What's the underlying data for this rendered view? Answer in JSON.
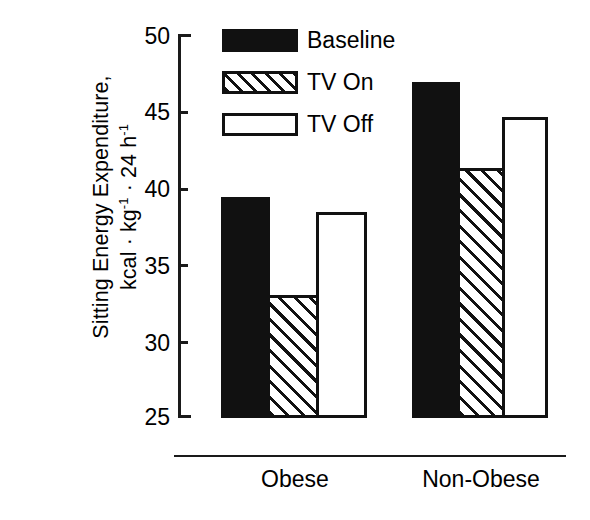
{
  "chart_data": {
    "type": "bar",
    "title": "",
    "xlabel": "",
    "ylabel_line1": "Sitting Energy Expenditure,",
    "ylabel_line2_prefix": "kcal · kg",
    "ylabel_line2_sup1": "-1",
    "ylabel_line2_mid": " · 24 h",
    "ylabel_line2_sup2": "-1",
    "ylabel_full": "Sitting Energy Expenditure, kcal · kg-1 · 24 h-1",
    "categories": [
      "Obese",
      "Non-Obese"
    ],
    "series": [
      {
        "name": "Baseline",
        "pattern": "solid",
        "values": [
          39.4,
          46.9
        ]
      },
      {
        "name": "TV On",
        "pattern": "hatch",
        "values": [
          33.0,
          41.3
        ]
      },
      {
        "name": "TV Off",
        "pattern": "open",
        "values": [
          38.4,
          44.6
        ]
      }
    ],
    "ylim": [
      25,
      50
    ],
    "yticks": [
      50,
      45,
      40,
      35,
      30,
      25
    ],
    "ytick_labels": [
      "50",
      "45",
      "40",
      "35",
      "30",
      "25"
    ],
    "grid": false,
    "legend_position": "top-center",
    "bar_baseline_value": 25,
    "colors": {
      "ink": "#111111",
      "axis": "#1a1a1a",
      "background": "#ffffff"
    }
  },
  "legend": {
    "items": [
      {
        "label": "Baseline",
        "pattern": "solid"
      },
      {
        "label": "TV On",
        "pattern": "hatch"
      },
      {
        "label": "TV Off",
        "pattern": "open"
      }
    ]
  },
  "axis": {
    "ytick_0": "50",
    "ytick_1": "45",
    "ytick_2": "40",
    "ytick_3": "35",
    "ytick_4": "30",
    "ytick_5": "25"
  },
  "categories": {
    "cat_0": "Obese",
    "cat_1": "Non-Obese"
  }
}
